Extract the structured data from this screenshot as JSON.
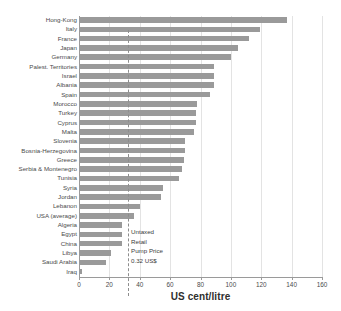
{
  "chart_data": {
    "type": "bar",
    "orientation": "horizontal",
    "title": "",
    "xlabel": "US cent/litre",
    "ylabel": "",
    "xlim": [
      0,
      160
    ],
    "xticks": [
      0,
      20,
      40,
      60,
      80,
      100,
      120,
      140,
      160
    ],
    "grid": true,
    "grid_axis": "x",
    "bar_color": "#9a9a9a",
    "categories": [
      "Hong-Kong",
      "Italy",
      "France",
      "Japan",
      "Germany",
      "Palest. Territories",
      "Israel",
      "Albania",
      "Spain",
      "Morocco",
      "Turkey",
      "Cyprus",
      "Malta",
      "Slovenia",
      "Bosnia-Herzegovina",
      "Greece",
      "Serbia & Montenegro",
      "Tunisia",
      "Syria",
      "Jordan",
      "Lebanon",
      "USA (average)",
      "Algeria",
      "Egypt",
      "China",
      "Libya",
      "Saudi Arabia",
      "Iraq"
    ],
    "values": [
      137,
      119,
      112,
      105,
      100,
      89,
      89,
      89,
      86,
      78,
      77,
      77,
      76,
      70,
      70,
      69,
      68,
      66,
      55,
      54,
      40,
      36,
      28,
      28,
      28,
      21,
      18,
      2
    ],
    "reference_line": {
      "value": 32,
      "style": "dashed",
      "label_lines": [
        "Untaxed",
        "Retail",
        "Pump Price",
        "0.32 US$"
      ]
    }
  }
}
